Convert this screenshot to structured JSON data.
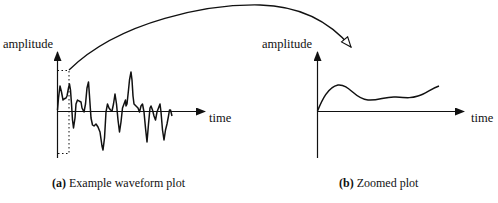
{
  "figure": {
    "left_panel": {
      "y_axis_label": "amplitude",
      "x_axis_label": "time",
      "caption_tag": "(a)",
      "caption_text": "Example waveform plot"
    },
    "right_panel": {
      "y_axis_label": "amplitude",
      "x_axis_label": "time",
      "caption_tag": "(b)",
      "caption_text": "Zoomed plot"
    },
    "connector": "curved-arrow-from-dotted-selection-to-zoomed-plot"
  }
}
